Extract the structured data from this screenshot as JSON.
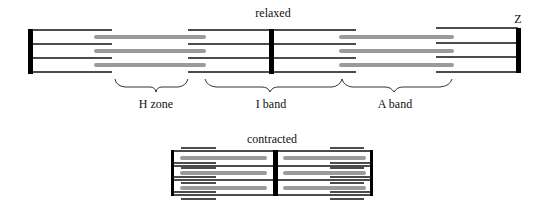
{
  "figure": {
    "title_relaxed": "relaxed",
    "title_contracted": "contracted",
    "z_label": "Z",
    "labels": {
      "h_zone": "H zone",
      "i_band": "I band",
      "a_band": "A band"
    },
    "colors": {
      "thin_filament": "#111111",
      "thick_filament": "#9a9a9a",
      "z_disc": "#000000"
    }
  }
}
